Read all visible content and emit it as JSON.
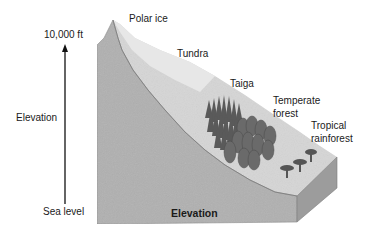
{
  "diagram": {
    "axis": {
      "top_label": "10,000 ft",
      "middle_label": "Elevation",
      "bottom_label": "Sea level"
    },
    "base_label": "Elevation",
    "zones": [
      {
        "name": "Polar ice"
      },
      {
        "name": "Tundra"
      },
      {
        "name": "Taiga"
      },
      {
        "name": "Temperate\nforest",
        "line1": "Temperate",
        "line2": "forest"
      },
      {
        "name": "Tropical\nrainforest",
        "line1": "Tropical",
        "line2": "rainforest"
      }
    ],
    "colors": {
      "front_face": "#b2b2b2",
      "side_face": "#9a9a9a",
      "slope_surface": "#d9d9d9",
      "ice": "#e6e6e6",
      "trees": "#5e5e5e"
    }
  }
}
